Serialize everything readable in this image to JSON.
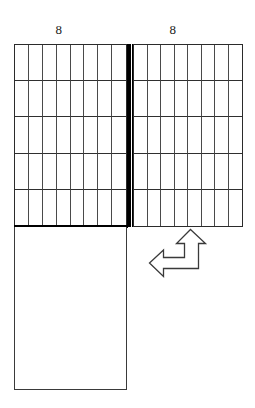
{
  "figure": {
    "title_labels": {
      "left_dimension": "8",
      "right_dimension": "8"
    },
    "panels": [
      {
        "id": "left-grid",
        "name": "left-grid-panel",
        "columns": 8,
        "rows": 5,
        "filled": false,
        "label": "8"
      },
      {
        "id": "right-grid",
        "name": "right-grid-panel",
        "columns": 8,
        "rows": 5,
        "filled": false,
        "label": "8"
      },
      {
        "id": "bottom-rect",
        "name": "bottom-blank-rectangle",
        "columns": 0,
        "rows": 0,
        "filled": false,
        "label": ""
      }
    ],
    "divider": {
      "name": "vertical-divider",
      "orientation": "vertical",
      "color": "#000000"
    },
    "arrow": {
      "name": "up-left-double-arrow",
      "directions": [
        "up",
        "left"
      ],
      "stroke": "#3a3a3a",
      "fill": "#ffffff"
    },
    "colors": {
      "ink": "#1a1a1a",
      "grid_line": "#4a4a4a",
      "grid_line_strong": "#2f2f2f",
      "border": "#2b2b2b",
      "background": "#ffffff",
      "divider": "#000000"
    }
  },
  "chart_data": {
    "type": "table",
    "title": "",
    "xlabel": "",
    "ylabel": "",
    "categories": [
      "left panel",
      "right panel",
      "bottom panel"
    ],
    "series": [
      {
        "name": "columns",
        "values": [
          8,
          8,
          0
        ]
      },
      {
        "name": "rows",
        "values": [
          5,
          5,
          0
        ]
      },
      {
        "name": "cells",
        "values": [
          40,
          40,
          0
        ]
      }
    ],
    "annotations": [
      "8",
      "8"
    ],
    "legend": "none",
    "grid": true
  }
}
